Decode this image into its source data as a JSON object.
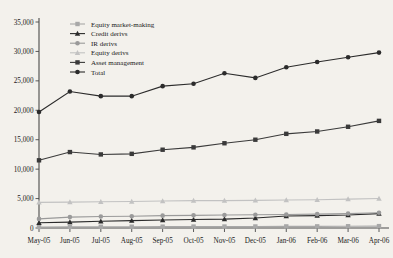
{
  "chart_data": {
    "type": "line",
    "title": "",
    "subtitle": "",
    "xlabel": "",
    "ylabel": "",
    "ylim": [
      0,
      35000
    ],
    "ytick_step": 5000,
    "grid": false,
    "legend_position": "top-left",
    "categories": [
      "May-05",
      "Jun-05",
      "Jul-05",
      "Aug-05",
      "Sep-05",
      "Oct-05",
      "Nov-05",
      "Dec-05",
      "Jan-06",
      "Feb-06",
      "Mar-06",
      "Apr-06"
    ],
    "ytick_labels": [
      "0",
      "5,000",
      "10,000",
      "15,000",
      "20,000",
      "25,000",
      "30,000",
      "35,000"
    ],
    "ytick_values": [
      0,
      5000,
      10000,
      15000,
      20000,
      25000,
      30000,
      35000
    ],
    "series": [
      {
        "name": "Equity market-making",
        "marker": "square",
        "color": "#a8a8a8",
        "line_color": "#a8a8a8",
        "values": [
          180,
          200,
          210,
          220,
          230,
          240,
          250,
          260,
          270,
          280,
          300,
          320
        ]
      },
      {
        "name": "Credit derivs",
        "marker": "triangle",
        "color": "#2b2b2b",
        "line_color": "#2b2b2b",
        "values": [
          900,
          1000,
          1150,
          1250,
          1350,
          1450,
          1500,
          1700,
          2050,
          2100,
          2200,
          2450
        ]
      },
      {
        "name": "IR derivs",
        "marker": "circle",
        "color": "#9a9a9a",
        "line_color": "#9a9a9a",
        "values": [
          1550,
          1850,
          1950,
          2000,
          2100,
          2150,
          2200,
          2250,
          2300,
          2350,
          2450,
          2600
        ]
      },
      {
        "name": "Equity derivs",
        "marker": "triangle",
        "color": "#c2c2c2",
        "line_color": "#c2c2c2",
        "values": [
          4350,
          4400,
          4450,
          4500,
          4600,
          4650,
          4650,
          4700,
          4750,
          4800,
          4900,
          5000
        ]
      },
      {
        "name": "Asset management",
        "marker": "square",
        "color": "#3a3a3a",
        "line_color": "#3a3a3a",
        "values": [
          11500,
          12900,
          12500,
          12600,
          13300,
          13700,
          14400,
          15000,
          16000,
          16400,
          17200,
          18200
        ]
      },
      {
        "name": "Total",
        "marker": "circle",
        "color": "#2b2b2b",
        "line_color": "#2b2b2b",
        "values": [
          19700,
          23200,
          22400,
          22400,
          24100,
          24500,
          26300,
          25500,
          27300,
          28200,
          29000,
          29800
        ]
      }
    ]
  }
}
